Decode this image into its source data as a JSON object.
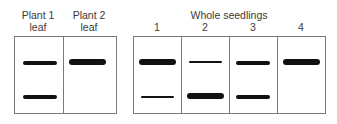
{
  "group1": {
    "lanes": [
      {
        "label_line1": "Plant 1",
        "label_line2": "leaf"
      },
      {
        "label_line1": "Plant 2",
        "label_line2": "leaf"
      }
    ]
  },
  "group2": {
    "title": "Whole seedlings",
    "lanes": [
      {
        "label": "1"
      },
      {
        "label": "2"
      },
      {
        "label": "3"
      },
      {
        "label": "4"
      }
    ]
  },
  "bands": {
    "plant1": [
      {
        "position": "upper",
        "intensity": "medium"
      },
      {
        "position": "lower",
        "intensity": "medium"
      }
    ],
    "plant2": [
      {
        "position": "upper",
        "intensity": "thick"
      }
    ],
    "seedling1": [
      {
        "position": "upper",
        "intensity": "thick"
      },
      {
        "position": "lower",
        "intensity": "thin"
      }
    ],
    "seedling2": [
      {
        "position": "upper",
        "intensity": "thin"
      },
      {
        "position": "lower",
        "intensity": "thick"
      }
    ],
    "seedling3": [
      {
        "position": "upper",
        "intensity": "medium"
      },
      {
        "position": "lower",
        "intensity": "medium"
      }
    ],
    "seedling4": [
      {
        "position": "upper",
        "intensity": "thick"
      }
    ]
  }
}
